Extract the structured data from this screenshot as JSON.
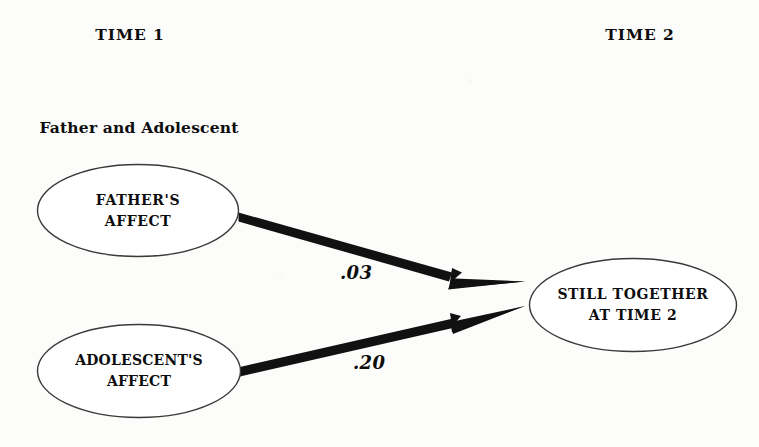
{
  "diagram": {
    "title_visible": false,
    "background_color": "#fcfcfb",
    "ink_color": "#0d0d0d",
    "columns": {
      "time1": {
        "header": "TIME 1",
        "subtitle_line1": "Father and Adolescent",
        "subtitle_line2": "Are Together"
      },
      "time2": {
        "header": "TIME 2"
      }
    },
    "nodes": [
      {
        "id": "fathers-affect",
        "shape": "ellipse",
        "line1": "FATHER'S",
        "line2": "AFFECT",
        "column": "time1"
      },
      {
        "id": "adolescents-affect",
        "shape": "ellipse",
        "line1": "ADOLESCENT'S",
        "line2": "AFFECT",
        "column": "time1"
      },
      {
        "id": "still-together",
        "shape": "ellipse",
        "line1": "STILL TOGETHER",
        "line2": "AT TIME 2",
        "column": "time2"
      }
    ],
    "paths": [
      {
        "id": "fathers-affect-to-still-together",
        "from": "fathers-affect",
        "to": "still-together",
        "coefficient": ".03"
      },
      {
        "id": "adolescents-affect-to-still-together",
        "from": "adolescents-affect",
        "to": "still-together",
        "coefficient": ".20"
      }
    ]
  }
}
